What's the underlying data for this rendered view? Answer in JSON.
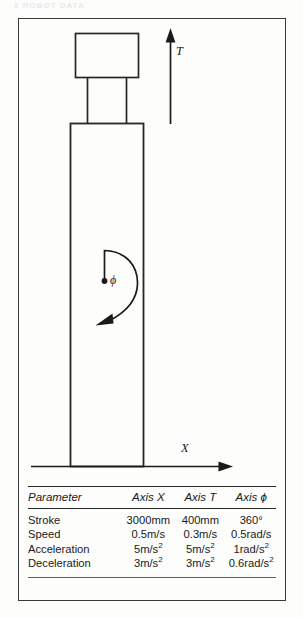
{
  "scan_header_fragment": "2  ROBOT DATA",
  "figure": {
    "axes": {
      "vertical_axis_label": "T",
      "horizontal_axis_label": "X",
      "rotation_axis_label": "ϕ"
    },
    "icons": {
      "t_arrow": "up-arrow-icon",
      "x_arrow": "right-arrow-icon",
      "phi_arc": "curved-rotation-arrow-icon",
      "pivot": "pivot-dot-icon"
    },
    "robot": {
      "head_label": "",
      "column_label": ""
    }
  },
  "table": {
    "columns": [
      "Parameter",
      "Axis X",
      "Axis T",
      "Axis ϕ"
    ],
    "rows": [
      {
        "parameter": "Stroke",
        "axis_x": "3000mm",
        "axis_t": "400mm",
        "axis_phi": "360°"
      },
      {
        "parameter": "Speed",
        "axis_x": "0.5m/s",
        "axis_t": "0.3m/s",
        "axis_phi": "0.5rad/s"
      },
      {
        "parameter": "Acceleration",
        "axis_x_num": "5m/s",
        "axis_x_exp": "2",
        "axis_t_num": "5m/s",
        "axis_t_exp": "2",
        "axis_phi_num": "1rad/s",
        "axis_phi_exp": "2"
      },
      {
        "parameter": "Deceleration",
        "axis_x_num": "3m/s",
        "axis_x_exp": "2",
        "axis_t_num": "3m/s",
        "axis_t_exp": "2",
        "axis_phi_num": "0.6rad/s",
        "axis_phi_exp": "2"
      }
    ]
  },
  "colors": {
    "ink": "#1a1a1a",
    "frame": "#3a3a3a",
    "rule": "#2a2a2a",
    "paper": "#fdfdfc"
  }
}
